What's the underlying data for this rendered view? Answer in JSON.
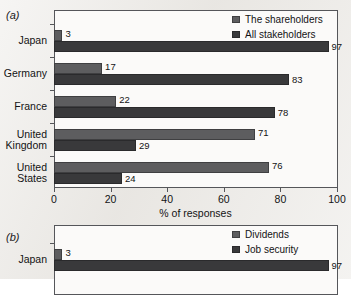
{
  "figure": {
    "background_color": "#ebe9e5",
    "panels": [
      {
        "tag": "(a)",
        "legend": [
          {
            "label": "The shareholders",
            "color": "#5d5d5f",
            "swatch": "legend-swatch-icon"
          },
          {
            "label": "All stakeholders",
            "color": "#39393b",
            "swatch": "legend-swatch-icon"
          }
        ],
        "xlabel": "% of responses"
      },
      {
        "tag": "(b)",
        "legend": [
          {
            "label": "Dividends",
            "color": "#5d5d5f",
            "swatch": "legend-swatch-icon"
          },
          {
            "label": "Job security",
            "color": "#39393b",
            "swatch": "legend-swatch-icon"
          }
        ],
        "xlabel": ""
      }
    ]
  },
  "chart_data": [
    {
      "type": "bar",
      "orientation": "horizontal",
      "panel": "(a)",
      "title": "",
      "xlabel": "% of responses",
      "ylabel": "",
      "xlim": [
        0,
        100
      ],
      "xticks": [
        0,
        20,
        40,
        60,
        80,
        100
      ],
      "xticklabels": [
        "0",
        "20",
        "40",
        "60",
        "80",
        "100"
      ],
      "grid": false,
      "legend_position": "top-right",
      "categories": [
        "Japan",
        "Germany",
        "France",
        "United Kingdom",
        "United States"
      ],
      "category_lines": [
        [
          "Japan"
        ],
        [
          "Germany"
        ],
        [
          "France"
        ],
        [
          "United",
          "Kingdom"
        ],
        [
          "United",
          "States"
        ]
      ],
      "series": [
        {
          "name": "The shareholders",
          "color": "#5d5d5f",
          "values": [
            3,
            17,
            22,
            71,
            76
          ]
        },
        {
          "name": "All stakeholders",
          "color": "#39393b",
          "values": [
            97,
            83,
            78,
            29,
            24
          ]
        }
      ]
    },
    {
      "type": "bar",
      "orientation": "horizontal",
      "panel": "(b)",
      "title": "",
      "xlabel": "",
      "ylabel": "",
      "xlim": [
        0,
        100
      ],
      "xticks": [],
      "xticklabels": [],
      "grid": false,
      "legend_position": "top-right",
      "categories": [
        "Japan"
      ],
      "category_lines": [
        [
          "Japan"
        ]
      ],
      "series": [
        {
          "name": "Dividends",
          "color": "#5d5d5f",
          "values": [
            3
          ]
        },
        {
          "name": "Job security",
          "color": "#39393b",
          "values": [
            97
          ]
        }
      ]
    }
  ]
}
